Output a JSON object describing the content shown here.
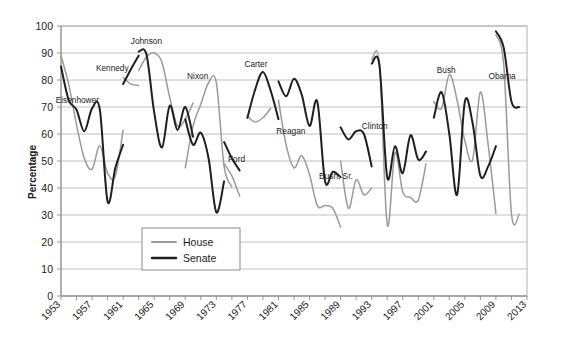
{
  "chart_data": {
    "type": "line",
    "title": "",
    "xlabel": "",
    "ylabel": "Percentage",
    "ylim": [
      0,
      100
    ],
    "ytick_step": 10,
    "yticks": [
      "0",
      "10",
      "20",
      "30",
      "40",
      "50",
      "60",
      "70",
      "80",
      "90",
      "100"
    ],
    "xlim": [
      1953,
      2013
    ],
    "xticks": [
      "1953",
      "1957",
      "1961",
      "1965",
      "1969",
      "1973",
      "1977",
      "1981",
      "1985",
      "1989",
      "1993",
      "1997",
      "2001",
      "2005",
      "2009",
      "2013"
    ],
    "xtick_step_years": 4,
    "minor_tick_step_years": 2,
    "grid": "horizontal",
    "legend_position": "inside-lower-left",
    "legend": [
      {
        "name": "House",
        "color": "#9a9a9a"
      },
      {
        "name": "Senate",
        "color": "#1f1f1f"
      }
    ],
    "annotations": [
      {
        "text": "Eisenhower",
        "x": 1955.1,
        "y": 71.5
      },
      {
        "text": "Kennedy",
        "x": 1959.6,
        "y": 83.2
      },
      {
        "text": "Johnson",
        "x": 1964.0,
        "y": 93.5
      },
      {
        "text": "Nixon",
        "x": 1970.6,
        "y": 80.5
      },
      {
        "text": "Ford",
        "x": 1975.6,
        "y": 49.5
      },
      {
        "text": "Carter",
        "x": 1978.1,
        "y": 85.0
      },
      {
        "text": "Reagan",
        "x": 1982.6,
        "y": 60.0
      },
      {
        "text": "Bush, Sr.",
        "x": 1988.4,
        "y": 43.5
      },
      {
        "text": "Clinton",
        "x": 1993.4,
        "y": 62.0
      },
      {
        "text": "Bush",
        "x": 2002.6,
        "y": 82.5
      },
      {
        "text": "Obama",
        "x": 2009.8,
        "y": 80.5
      }
    ],
    "series": [
      {
        "name": "House",
        "color": "#9a9a9a",
        "segments": [
          {
            "president": "Eisenhower",
            "points": [
              [
                1953,
                89.0
              ],
              [
                1954,
                78.3
              ],
              [
                1955,
                63.4
              ],
              [
                1956,
                51.0
              ],
              [
                1957,
                47.0
              ],
              [
                1958,
                55.6
              ],
              [
                1959,
                45.5
              ],
              [
                1960,
                44.5
              ],
              [
                1961,
                61.5
              ]
            ]
          },
          {
            "president": "Kennedy",
            "points": [
              [
                1961,
                81.0
              ],
              [
                1962,
                78.5
              ],
              [
                1963,
                78.0
              ]
            ]
          },
          {
            "president": "Johnson",
            "points": [
              [
                1963,
                83.5
              ],
              [
                1964,
                88.5
              ],
              [
                1965,
                90.0
              ],
              [
                1966,
                86.5
              ],
              [
                1967,
                73.5
              ],
              [
                1968,
                63.0
              ],
              [
                1969,
                65.5
              ],
              [
                1970,
                71.5
              ]
            ]
          },
          {
            "president": "Nixon",
            "points": [
              [
                1969,
                47.5
              ],
              [
                1970,
                63.0
              ],
              [
                1971,
                71.0
              ],
              [
                1972,
                79.0
              ],
              [
                1973,
                79.0
              ],
              [
                1974,
                48.0
              ],
              [
                1975,
                40.5
              ]
            ]
          },
          {
            "president": "Ford",
            "points": [
              [
                1974,
                49.0
              ],
              [
                1975,
                44.5
              ],
              [
                1976,
                37.0
              ]
            ]
          },
          {
            "president": "Carter",
            "points": [
              [
                1977,
                66.5
              ],
              [
                1978,
                64.5
              ],
              [
                1979,
                66.0
              ],
              [
                1980,
                69.5
              ]
            ]
          },
          {
            "president": "Reagan",
            "points": [
              [
                1981,
                72.5
              ],
              [
                1982,
                55.8
              ],
              [
                1983,
                47.5
              ],
              [
                1984,
                52.0
              ],
              [
                1985,
                45.0
              ],
              [
                1986,
                33.5
              ],
              [
                1987,
                33.5
              ],
              [
                1988,
                32.5
              ],
              [
                1989,
                25.5
              ]
            ]
          },
          {
            "president": "Bush, Sr.",
            "points": [
              [
                1989,
                50.0
              ],
              [
                1990,
                32.5
              ],
              [
                1991,
                43.0
              ],
              [
                1992,
                37.5
              ],
              [
                1993,
                40.0
              ]
            ]
          },
          {
            "president": "Clinton",
            "points": [
              [
                1993,
                87.5
              ],
              [
                1994,
                86.0
              ],
              [
                1995,
                26.5
              ],
              [
                1996,
                53.0
              ],
              [
                1997,
                38.5
              ],
              [
                1998,
                36.5
              ],
              [
                1999,
                35.5
              ],
              [
                2000,
                49.0
              ]
            ]
          },
          {
            "president": "Bush",
            "points": [
              [
                2001,
                72.0
              ],
              [
                2002,
                69.5
              ],
              [
                2003,
                82.0
              ],
              [
                2004,
                72.5
              ],
              [
                2005,
                57.5
              ],
              [
                2006,
                50.5
              ],
              [
                2007,
                75.5
              ],
              [
                2008,
                56.0
              ],
              [
                2009,
                30.5
              ]
            ]
          },
          {
            "president": "Obama",
            "points": [
              [
                2009,
                96.7
              ],
              [
                2010,
                85.8
              ],
              [
                2011,
                30.5
              ],
              [
                2012,
                30.3
              ]
            ]
          }
        ]
      },
      {
        "name": "Senate",
        "color": "#1f1f1f",
        "segments": [
          {
            "president": "Eisenhower",
            "points": [
              [
                1953,
                85.0
              ],
              [
                1954,
                72.5
              ],
              [
                1955,
                69.0
              ],
              [
                1956,
                61.0
              ],
              [
                1957,
                69.5
              ],
              [
                1958,
                69.0
              ],
              [
                1959,
                35.0
              ],
              [
                1960,
                47.5
              ],
              [
                1961,
                56.0
              ]
            ]
          },
          {
            "president": "Kennedy",
            "points": [
              [
                1961,
                78.5
              ],
              [
                1962,
                84.0
              ],
              [
                1963,
                89.0
              ]
            ]
          },
          {
            "president": "Johnson",
            "points": [
              [
                1963,
                90.5
              ],
              [
                1964,
                89.5
              ],
              [
                1965,
                68.0
              ],
              [
                1966,
                55.0
              ],
              [
                1967,
                70.5
              ],
              [
                1968,
                61.5
              ],
              [
                1969,
                70.0
              ],
              [
                1970,
                59.0
              ]
            ]
          },
          {
            "president": "Nixon",
            "points": [
              [
                1969,
                65.5
              ],
              [
                1970,
                56.0
              ],
              [
                1971,
                60.5
              ],
              [
                1972,
                51.0
              ],
              [
                1973,
                31.0
              ],
              [
                1974,
                42.5
              ]
            ]
          },
          {
            "president": "Ford",
            "points": [
              [
                1974,
                57.0
              ],
              [
                1975,
                51.0
              ],
              [
                1976,
                46.5
              ]
            ]
          },
          {
            "president": "Carter",
            "points": [
              [
                1977,
                66.0
              ],
              [
                1978,
                76.5
              ],
              [
                1979,
                83.0
              ],
              [
                1980,
                76.0
              ],
              [
                1981,
                65.5
              ]
            ]
          },
          {
            "president": "Reagan",
            "points": [
              [
                1981,
                79.5
              ],
              [
                1982,
                74.0
              ],
              [
                1983,
                80.5
              ],
              [
                1984,
                74.5
              ],
              [
                1985,
                63.0
              ],
              [
                1986,
                72.0
              ],
              [
                1987,
                42.5
              ],
              [
                1988,
                46.0
              ],
              [
                1989,
                44.0
              ]
            ]
          },
          {
            "president": "Bush, Sr.",
            "points": [
              [
                1989,
                62.5
              ],
              [
                1990,
                58.0
              ],
              [
                1991,
                61.0
              ],
              [
                1992,
                60.0
              ],
              [
                1993,
                48.0
              ]
            ]
          },
          {
            "president": "Clinton",
            "points": [
              [
                1993,
                86.0
              ],
              [
                1994,
                85.5
              ],
              [
                1995,
                44.0
              ],
              [
                1996,
                55.5
              ],
              [
                1997,
                45.5
              ],
              [
                1998,
                59.5
              ],
              [
                1999,
                50.5
              ],
              [
                2000,
                53.5
              ]
            ]
          },
          {
            "president": "Bush",
            "points": [
              [
                2001,
                66.0
              ],
              [
                2002,
                75.5
              ],
              [
                2003,
                60.0
              ],
              [
                2004,
                37.5
              ],
              [
                2005,
                72.0
              ],
              [
                2006,
                64.0
              ],
              [
                2007,
                44.5
              ],
              [
                2008,
                48.0
              ],
              [
                2009,
                55.5
              ]
            ]
          },
          {
            "president": "Obama",
            "points": [
              [
                2009,
                98.0
              ],
              [
                2010,
                92.0
              ],
              [
                2011,
                72.0
              ],
              [
                2012,
                70.0
              ]
            ]
          }
        ]
      }
    ]
  }
}
